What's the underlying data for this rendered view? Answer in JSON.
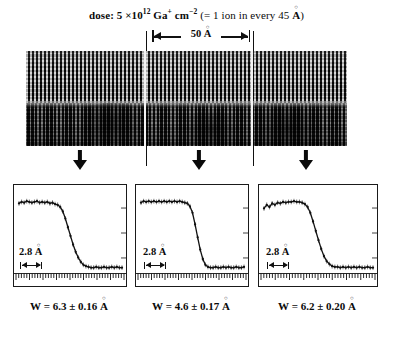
{
  "figure": {
    "dose_caption": {
      "prefix": "dose: 5 ×10",
      "exponent": "12",
      "species": "Ga",
      "species_charge": "+",
      "unit": "cm",
      "unit_exponent": "−2",
      "paren": "(= 1 ion in every 45 ",
      "angstrom": "A",
      "paren_close": ")"
    },
    "scale_bar": {
      "value": "50",
      "angstrom": "A"
    },
    "micrograph": {
      "description": "high-resolution-tem-lattice-image",
      "regions": 3
    },
    "arrows": [
      {
        "name": "arrow-region-1"
      },
      {
        "name": "arrow-region-2"
      },
      {
        "name": "arrow-region-3"
      }
    ],
    "plots": [
      {
        "id": "profile-1",
        "spacing_label": "2.8",
        "spacing_unit": "A",
        "w_label": "W = 6.3 ± 0.16 ",
        "w_unit": "A"
      },
      {
        "id": "profile-2",
        "spacing_label": "2.8",
        "spacing_unit": "A",
        "w_label": "W = 4.6 ± 0.17 ",
        "w_unit": "A"
      },
      {
        "id": "profile-3",
        "spacing_label": "2.8",
        "spacing_unit": "A",
        "w_label": "W = 6.2 ± 0.20 ",
        "w_unit": "A"
      }
    ]
  },
  "chart_data": [
    {
      "type": "line",
      "id": "profile-1",
      "title": "W = 6.3 ± 0.16 A",
      "xlabel": "position (A)",
      "ylabel": "intensity (arb. units)",
      "xlim": [
        0,
        40
      ],
      "ylim": [
        0,
        1.08
      ],
      "grid": false,
      "legend": "none",
      "annotations": [
        "2.8 A lattice spacing marker"
      ],
      "x": [
        0,
        1,
        2,
        3,
        4,
        5,
        6,
        7,
        8,
        9,
        10,
        11,
        12,
        13,
        14,
        15,
        16,
        17,
        18,
        19,
        20,
        21,
        22,
        23,
        24,
        25,
        26,
        27,
        28,
        29,
        30,
        31,
        32,
        33,
        34,
        35,
        36,
        37,
        38,
        39,
        40
      ],
      "values": [
        0.95,
        0.97,
        0.96,
        0.98,
        0.97,
        0.96,
        0.97,
        0.98,
        0.96,
        0.97,
        0.96,
        0.97,
        0.95,
        0.96,
        0.94,
        0.93,
        0.9,
        0.84,
        0.74,
        0.62,
        0.5,
        0.38,
        0.28,
        0.2,
        0.14,
        0.1,
        0.08,
        0.07,
        0.06,
        0.06,
        0.07,
        0.06,
        0.06,
        0.07,
        0.06,
        0.06,
        0.07,
        0.06,
        0.07,
        0.06,
        0.06
      ]
    },
    {
      "type": "line",
      "id": "profile-2",
      "title": "W = 4.6 ± 0.17 A",
      "xlabel": "position (A)",
      "ylabel": "intensity (arb. units)",
      "xlim": [
        0,
        40
      ],
      "ylim": [
        0,
        1.08
      ],
      "grid": false,
      "legend": "none",
      "annotations": [
        "2.8 A lattice spacing marker"
      ],
      "x": [
        0,
        1,
        2,
        3,
        4,
        5,
        6,
        7,
        8,
        9,
        10,
        11,
        12,
        13,
        14,
        15,
        16,
        17,
        18,
        19,
        20,
        21,
        22,
        23,
        24,
        25,
        26,
        27,
        28,
        29,
        30,
        31,
        32,
        33,
        34,
        35,
        36,
        37,
        38,
        39,
        40
      ],
      "values": [
        0.96,
        0.98,
        0.97,
        0.98,
        0.97,
        0.98,
        0.97,
        0.98,
        0.97,
        0.98,
        0.97,
        0.98,
        0.97,
        0.98,
        0.97,
        0.98,
        0.97,
        0.96,
        0.95,
        0.91,
        0.82,
        0.66,
        0.48,
        0.31,
        0.18,
        0.1,
        0.07,
        0.06,
        0.06,
        0.07,
        0.06,
        0.06,
        0.07,
        0.06,
        0.07,
        0.06,
        0.06,
        0.07,
        0.06,
        0.06,
        0.07
      ]
    },
    {
      "type": "line",
      "id": "profile-3",
      "title": "W = 6.2 ± 0.20 A",
      "xlabel": "position (A)",
      "ylabel": "intensity (arb. units)",
      "xlim": [
        0,
        40
      ],
      "ylim": [
        0,
        1.08
      ],
      "grid": false,
      "legend": "none",
      "annotations": [
        "2.8 A lattice spacing marker"
      ],
      "x": [
        0,
        1,
        2,
        3,
        4,
        5,
        6,
        7,
        8,
        9,
        10,
        11,
        12,
        13,
        14,
        15,
        16,
        17,
        18,
        19,
        20,
        21,
        22,
        23,
        24,
        25,
        26,
        27,
        28,
        29,
        30,
        31,
        32,
        33,
        34,
        35,
        36,
        37,
        38,
        39,
        40
      ],
      "values": [
        0.88,
        0.93,
        0.9,
        0.95,
        0.93,
        0.96,
        0.95,
        0.97,
        0.96,
        0.97,
        0.97,
        0.98,
        0.97,
        0.97,
        0.96,
        0.94,
        0.9,
        0.82,
        0.7,
        0.57,
        0.44,
        0.32,
        0.22,
        0.15,
        0.11,
        0.08,
        0.07,
        0.07,
        0.06,
        0.07,
        0.06,
        0.07,
        0.06,
        0.07,
        0.06,
        0.07,
        0.06,
        0.06,
        0.07,
        0.06,
        0.06
      ]
    }
  ]
}
